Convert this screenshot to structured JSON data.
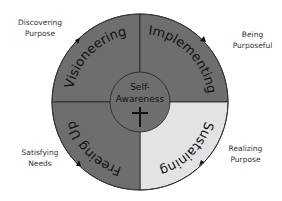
{
  "diagram": {
    "center_label_line1": "Self-",
    "center_label_line2": "Awareness",
    "center_icon": "cross-icon",
    "segments": [
      {
        "label": "Visioneering",
        "position": "top-left",
        "fill": "#6e6e6e"
      },
      {
        "label": "Implementing",
        "position": "top-right",
        "fill": "#6e6e6e"
      },
      {
        "label": "Sustaining",
        "position": "bottom-right",
        "fill": "#e3e3e3"
      },
      {
        "label": "Freeing Up",
        "position": "bottom-left",
        "fill": "#6e6e6e"
      }
    ],
    "outer_labels": {
      "top_left_line1": "Discovering",
      "top_left_line2": "Purpose",
      "top_right_line1": "Being",
      "top_right_line2": "Purposeful",
      "bottom_right_line1": "Realizing",
      "bottom_right_line2": "Purpose",
      "bottom_left_line1": "Satisfying",
      "bottom_left_line2": "Needs"
    },
    "colors": {
      "dark_segment": "#6e6e6e",
      "light_segment": "#e3e3e3",
      "stroke": "#222222",
      "text": "#111111"
    }
  }
}
